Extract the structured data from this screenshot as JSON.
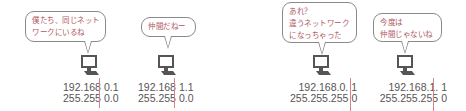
{
  "colors": {
    "speech_text": "#b0575f",
    "bubble_border": "#8a8a8a",
    "address_text": "#555555",
    "divider_line": "#d9828a",
    "pc_icon": "#555555"
  },
  "scenes": [
    {
      "bubble": {
        "lines": [
          "僕たち、同じネット",
          "ワークにいるね"
        ]
      },
      "pc_icon": "desktop-computer-icon",
      "ip": {
        "network": "192.168",
        "host": "0.1"
      },
      "mask": {
        "network": "255.255",
        "host": "0.0"
      }
    },
    {
      "bubble": {
        "lines": [
          "仲間だねー"
        ]
      },
      "pc_icon": "desktop-computer-icon",
      "ip": {
        "network": "192.168",
        "host": "1.1"
      },
      "mask": {
        "network": "255.255",
        "host": "0.0"
      }
    },
    {
      "bubble": {
        "lines": [
          "あれ？",
          "違うネットワーク",
          "になっちゃった"
        ]
      },
      "pc_icon": "desktop-computer-icon",
      "ip": {
        "network": "192.168.0.",
        "host": "1"
      },
      "mask": {
        "network": "255.255.255",
        "host": "0"
      }
    },
    {
      "bubble": {
        "lines": [
          "今度は",
          "仲間じゃないね"
        ]
      },
      "pc_icon": "desktop-computer-icon",
      "ip": {
        "network": "192.168.1.",
        "host": "1"
      },
      "mask": {
        "network": "255.255.255",
        "host": "0"
      }
    }
  ]
}
